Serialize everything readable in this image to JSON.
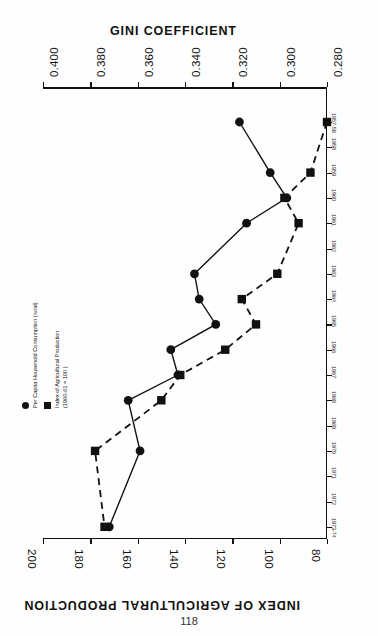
{
  "page": {
    "number": "118"
  },
  "chart_data": {
    "type": "line",
    "title": "",
    "orientation": "rotated-90",
    "x": [
      "1957-58",
      "1958",
      "1959",
      "1960",
      "1961",
      "1962",
      "1963",
      "1964",
      "1965",
      "1966",
      "1967",
      "1968",
      "1969",
      "1970",
      "1971",
      "1972",
      "1973-74"
    ],
    "xlabel": "",
    "axes": [
      {
        "id": "gini",
        "label": "GINI  COEFFICIENT",
        "ticks": [
          "0.400",
          "0.380",
          "0.360",
          "0.340",
          "0.320",
          "0.300",
          "0.280"
        ],
        "range": [
          0.4,
          0.28
        ],
        "position": "top"
      },
      {
        "id": "index",
        "label": "INDEX OF AGRICULTURAL PRODUCTION",
        "ticks": [
          "200",
          "180",
          "160",
          "140",
          "120",
          "100",
          "80"
        ],
        "range": [
          200,
          80
        ],
        "position": "bottom"
      }
    ],
    "series": [
      {
        "name": "Per Capita Household Consumption (rural)",
        "marker": "circle",
        "linestyle": "solid",
        "axis": "gini",
        "points": [
          {
            "x": "1957-58",
            "y": 0.317
          },
          {
            "x": "1959",
            "y": 0.304
          },
          {
            "x": "1960",
            "y": 0.297
          },
          {
            "x": "1961",
            "y": 0.314
          },
          {
            "x": "1963",
            "y": 0.336
          },
          {
            "x": "1964",
            "y": 0.334
          },
          {
            "x": "1965",
            "y": 0.327
          },
          {
            "x": "1966",
            "y": 0.346
          },
          {
            "x": "1967",
            "y": 0.343
          },
          {
            "x": "1968",
            "y": 0.364
          },
          {
            "x": "1970",
            "y": 0.359
          },
          {
            "x": "1973-74",
            "y": 0.372
          }
        ]
      },
      {
        "name": "Index of Agricultural Production (1960-61 = 100 )",
        "marker": "square",
        "linestyle": "dashed",
        "axis": "index",
        "points": [
          {
            "x": "1957-58",
            "y": 80
          },
          {
            "x": "1959",
            "y": 87
          },
          {
            "x": "1960",
            "y": 98
          },
          {
            "x": "1961",
            "y": 92
          },
          {
            "x": "1963",
            "y": 101
          },
          {
            "x": "1964",
            "y": 116
          },
          {
            "x": "1965",
            "y": 110
          },
          {
            "x": "1966",
            "y": 123
          },
          {
            "x": "1967",
            "y": 142
          },
          {
            "x": "1968",
            "y": 150
          },
          {
            "x": "1970",
            "y": 178
          },
          {
            "x": "1973-74",
            "y": 174
          }
        ]
      }
    ],
    "legend": {
      "position": "left",
      "entries": [
        {
          "marker": "circle",
          "label_line1": "Per Capita Household Consumption (rural)",
          "label_line2": ""
        },
        {
          "marker": "square",
          "label_line1": "Index of Agricultural Production",
          "label_line2": "(1960-61 = 100 )"
        }
      ]
    },
    "grid": false
  }
}
